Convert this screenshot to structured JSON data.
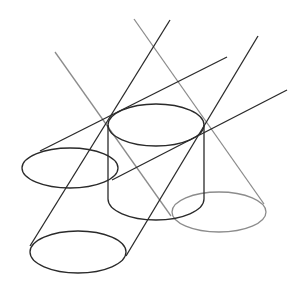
{
  "diagram": {
    "colors": {
      "dark_stroke": "#2a2a2a",
      "gray_stroke": "#8c8c8c",
      "background": "#ffffff"
    },
    "shapes": {
      "central_cylinder": {
        "top_ellipse": {
          "cx": 156,
          "cy": 125,
          "rx": 48,
          "ry": 21
        },
        "bottom_y": 199
      },
      "left_ellipse": {
        "cx": 70,
        "cy": 168,
        "rx": 48,
        "ry": 20
      },
      "bottom_left_ellipse": {
        "cx": 78,
        "cy": 252,
        "rx": 48,
        "ry": 21
      },
      "gray_right_ellipse": {
        "cx": 219,
        "cy": 212,
        "rx": 47,
        "ry": 20
      }
    },
    "lines": {
      "dark": [
        {
          "x1": 227,
          "y1": 57,
          "x2": 40,
          "y2": 151
        },
        {
          "x1": 287,
          "y1": 90,
          "x2": 110,
          "y2": 180
        },
        {
          "x1": 170,
          "y1": 20,
          "x2": 30,
          "y2": 244
        },
        {
          "x1": 258,
          "y1": 36,
          "x2": 126,
          "y2": 256
        }
      ],
      "gray": [
        {
          "x1": 55,
          "y1": 52,
          "x2": 171,
          "y2": 216
        },
        {
          "x1": 134,
          "y1": 19,
          "x2": 264,
          "y2": 204
        }
      ]
    }
  }
}
